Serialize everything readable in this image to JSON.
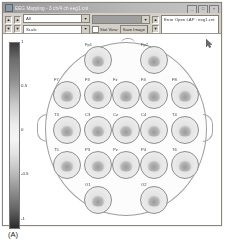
{
  "window": {
    "title": "EEG Mapping - 3 ch/4 ch  eeg1.cnt",
    "icon": "eeg-window-icon",
    "buttons": [
      {
        "name": "minimize",
        "glyph": "_"
      },
      {
        "name": "maximize",
        "glyph": "□"
      },
      {
        "name": "close",
        "glyph": "×"
      }
    ]
  },
  "toolbar": {
    "spinner_up": "▲",
    "spinner_down": "▼",
    "combo_top_value": "All",
    "combo_bottom_value": "Scale",
    "combo_arrow": "▼",
    "palette_value": "",
    "checkbox_label": "Stat View",
    "checkbox_checked": false,
    "save_button_label": "Save Image",
    "info_field_value": "Error Open LAP : eeg1.cnt"
  },
  "plot": {
    "colorbar": {
      "max_label": "1",
      "ticks": [
        "1",
        "0.5",
        "0",
        "-0.5",
        "-1"
      ],
      "min_label": "-1",
      "colormap": "grayscale"
    },
    "head_outline": "head-outline",
    "montage_name": "10-20",
    "electrodes": [
      {
        "label": "Fp1",
        "x": 55,
        "y": 10
      },
      {
        "label": "Fp2",
        "x": 111,
        "y": 10
      },
      {
        "label": "F7",
        "x": 24,
        "y": 45
      },
      {
        "label": "F3",
        "x": 55,
        "y": 45
      },
      {
        "label": "Fz",
        "x": 83,
        "y": 45
      },
      {
        "label": "F4",
        "x": 111,
        "y": 45
      },
      {
        "label": "F8",
        "x": 142,
        "y": 45
      },
      {
        "label": "T3",
        "x": 24,
        "y": 80
      },
      {
        "label": "C3",
        "x": 55,
        "y": 80
      },
      {
        "label": "Cz",
        "x": 83,
        "y": 80
      },
      {
        "label": "C4",
        "x": 111,
        "y": 80
      },
      {
        "label": "T4",
        "x": 142,
        "y": 80
      },
      {
        "label": "T5",
        "x": 24,
        "y": 115
      },
      {
        "label": "P3",
        "x": 55,
        "y": 115
      },
      {
        "label": "Pz",
        "x": 83,
        "y": 115
      },
      {
        "label": "P4",
        "x": 111,
        "y": 115
      },
      {
        "label": "T6",
        "x": 142,
        "y": 115
      },
      {
        "label": "O1",
        "x": 55,
        "y": 150
      },
      {
        "label": "O2",
        "x": 111,
        "y": 150
      }
    ],
    "cursor": "arrow-cursor"
  },
  "caption": "(A)"
}
